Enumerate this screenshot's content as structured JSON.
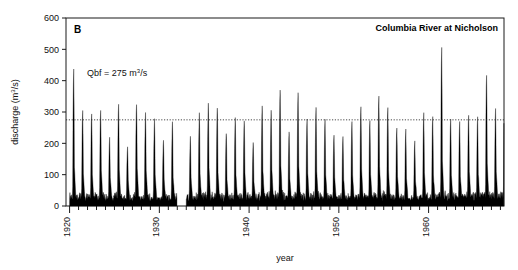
{
  "figure": {
    "panel_label": "B",
    "station_label": "Columbia River at Nicholson",
    "annotation": "Qbf = 275 m",
    "annotation_sup": "3",
    "annotation_tail": "/s",
    "xlabel": "year",
    "ylabel_pre": "discharge (m",
    "ylabel_sup": "3",
    "ylabel_post": "/s)"
  },
  "chart_data": {
    "type": "line",
    "title": "Columbia River at Nicholson",
    "panel": "B",
    "xlabel": "year",
    "ylabel": "discharge (m3/s)",
    "xlim": [
      1919.6,
      1968.4
    ],
    "ylim": [
      0,
      600
    ],
    "ytick_values": [
      0,
      100,
      200,
      300,
      400,
      500,
      600
    ],
    "ytick_labels": [
      "0",
      "100",
      "200",
      "300",
      "400",
      "500",
      "600"
    ],
    "xtick_major_values": [
      1920,
      1930,
      1940,
      1950,
      1960
    ],
    "xtick_major_labels": [
      "1920",
      "1930",
      "1940",
      "1950",
      "1960"
    ],
    "xtick_minor_step": 1,
    "grid": false,
    "legend": false,
    "reference_line": {
      "label": "Qbf",
      "value": 275,
      "units": "m3/s",
      "style": "dotted",
      "orientation": "horizontal"
    },
    "data_gap_years": [
      1932
    ],
    "series": [
      {
        "name": "mean daily discharge",
        "units": "m3/s",
        "baseflow_winter": 18,
        "annual_peaks": [
          {
            "year": 1920,
            "peak": 465,
            "secondary": 120
          },
          {
            "year": 1921,
            "peak": 330,
            "secondary": 110
          },
          {
            "year": 1922,
            "peak": 320,
            "secondary": 100
          },
          {
            "year": 1923,
            "peak": 330,
            "secondary": 115
          },
          {
            "year": 1924,
            "peak": 232,
            "secondary": 95
          },
          {
            "year": 1925,
            "peak": 352,
            "secondary": 120
          },
          {
            "year": 1926,
            "peak": 205,
            "secondary": 85
          },
          {
            "year": 1927,
            "peak": 352,
            "secondary": 130
          },
          {
            "year": 1928,
            "peak": 322,
            "secondary": 118
          },
          {
            "year": 1929,
            "peak": 295,
            "secondary": 100
          },
          {
            "year": 1930,
            "peak": 225,
            "secondary": 88
          },
          {
            "year": 1931,
            "peak": 290,
            "secondary": 95
          },
          {
            "year": 1932,
            "peak": 0,
            "secondary": 0
          },
          {
            "year": 1933,
            "peak": 237,
            "secondary": 92
          },
          {
            "year": 1934,
            "peak": 318,
            "secondary": 105
          },
          {
            "year": 1935,
            "peak": 352,
            "secondary": 125
          },
          {
            "year": 1936,
            "peak": 340,
            "secondary": 112
          },
          {
            "year": 1937,
            "peak": 252,
            "secondary": 90
          },
          {
            "year": 1938,
            "peak": 300,
            "secondary": 100
          },
          {
            "year": 1939,
            "peak": 295,
            "secondary": 108
          },
          {
            "year": 1940,
            "peak": 218,
            "secondary": 85
          },
          {
            "year": 1941,
            "peak": 345,
            "secondary": 118
          },
          {
            "year": 1942,
            "peak": 325,
            "secondary": 128
          },
          {
            "year": 1943,
            "peak": 398,
            "secondary": 140
          },
          {
            "year": 1944,
            "peak": 258,
            "secondary": 95
          },
          {
            "year": 1945,
            "peak": 385,
            "secondary": 132
          },
          {
            "year": 1946,
            "peak": 300,
            "secondary": 110
          },
          {
            "year": 1947,
            "peak": 340,
            "secondary": 120
          },
          {
            "year": 1948,
            "peak": 298,
            "secondary": 105
          },
          {
            "year": 1949,
            "peak": 245,
            "secondary": 92
          },
          {
            "year": 1950,
            "peak": 240,
            "secondary": 90
          },
          {
            "year": 1951,
            "peak": 290,
            "secondary": 100
          },
          {
            "year": 1952,
            "peak": 340,
            "secondary": 122
          },
          {
            "year": 1953,
            "peak": 295,
            "secondary": 108
          },
          {
            "year": 1954,
            "peak": 378,
            "secondary": 135
          },
          {
            "year": 1955,
            "peak": 340,
            "secondary": 118
          },
          {
            "year": 1956,
            "peak": 272,
            "secondary": 100
          },
          {
            "year": 1957,
            "peak": 262,
            "secondary": 95
          },
          {
            "year": 1958,
            "peak": 225,
            "secondary": 88
          },
          {
            "year": 1959,
            "peak": 318,
            "secondary": 110
          },
          {
            "year": 1960,
            "peak": 305,
            "secondary": 102
          },
          {
            "year": 1961,
            "peak": 540,
            "secondary": 145
          },
          {
            "year": 1962,
            "peak": 300,
            "secondary": 105
          },
          {
            "year": 1963,
            "peak": 288,
            "secondary": 98
          },
          {
            "year": 1964,
            "peak": 312,
            "secondary": 115
          },
          {
            "year": 1965,
            "peak": 305,
            "secondary": 110
          },
          {
            "year": 1966,
            "peak": 452,
            "secondary": 138
          },
          {
            "year": 1967,
            "peak": 330,
            "secondary": 120
          },
          {
            "year": 1968,
            "peak": 438,
            "secondary": 130
          }
        ]
      }
    ]
  }
}
